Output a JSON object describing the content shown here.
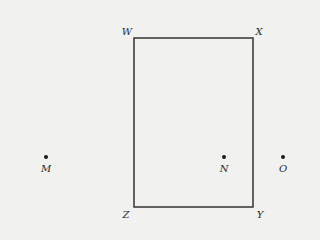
{
  "diagram": {
    "rectangle": {
      "x": 134,
      "y": 38,
      "width": 119,
      "height": 169,
      "stroke": "#333333",
      "stroke_width": 1.5
    },
    "vertices": [
      {
        "id": "W",
        "label": "W",
        "corner": "top-left",
        "label_x": 127,
        "label_y": 32
      },
      {
        "id": "X",
        "label": "X",
        "corner": "top-right",
        "label_x": 259,
        "label_y": 32
      },
      {
        "id": "Y",
        "label": "Y",
        "corner": "bottom-right",
        "label_x": 260,
        "label_y": 215
      },
      {
        "id": "Z",
        "label": "Z",
        "corner": "bottom-left",
        "label_x": 126,
        "label_y": 215
      }
    ],
    "points": [
      {
        "id": "M",
        "label": "M",
        "x": 46,
        "y": 157,
        "label_x": 46,
        "label_y": 169
      },
      {
        "id": "N",
        "label": "N",
        "x": 224,
        "y": 157,
        "label_x": 224,
        "label_y": 169
      },
      {
        "id": "O",
        "label": "O",
        "x": 283,
        "y": 157,
        "label_x": 283,
        "label_y": 169
      }
    ],
    "colors": {
      "background": "#f1f1ef",
      "ink": "#2a2a2a"
    }
  }
}
